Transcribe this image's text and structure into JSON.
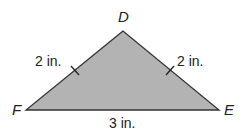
{
  "figure": {
    "type": "triangle",
    "fill_color": "#b3b3b3",
    "stroke_color": "#333333",
    "vertices": {
      "D": {
        "label": "D",
        "x": 123,
        "y": 31
      },
      "F": {
        "label": "F",
        "x": 26,
        "y": 110
      },
      "E": {
        "label": "E",
        "x": 219,
        "y": 110
      }
    },
    "sides": {
      "FD": {
        "label": "2 in.",
        "congruent_tick": true
      },
      "DE": {
        "label": "2 in.",
        "congruent_tick": true
      },
      "FE": {
        "label": "3 in.",
        "congruent_tick": false
      }
    }
  }
}
